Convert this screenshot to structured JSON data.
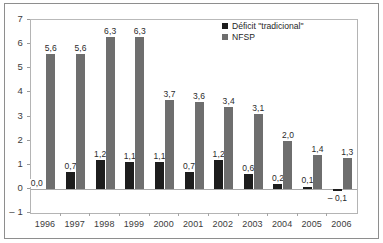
{
  "chart_data": {
    "type": "bar",
    "title": "",
    "xlabel": "",
    "ylabel": "",
    "categories": [
      "1996",
      "1997",
      "1998",
      "1999",
      "2000",
      "2001",
      "2002",
      "2003",
      "2004",
      "2005",
      "2006"
    ],
    "series": [
      {
        "name": "Déficit \"tradicional\"",
        "color": "#1d1d1d",
        "values": [
          0.0,
          0.7,
          1.2,
          1.1,
          1.1,
          0.7,
          1.2,
          0.6,
          0.2,
          0.1,
          -0.1
        ],
        "labels": [
          "0,0",
          "0,7",
          "1,2",
          "1,1",
          "1,1",
          "0,7",
          "1,2",
          "0,6",
          "0,2",
          "0,1",
          "– 0,1"
        ]
      },
      {
        "name": "NFSP",
        "color": "#6e6e6e",
        "values": [
          5.6,
          5.6,
          6.3,
          6.3,
          3.7,
          3.6,
          3.4,
          3.1,
          2.0,
          1.4,
          1.3
        ],
        "labels": [
          "5,6",
          "5,6",
          "6,3",
          "6,3",
          "3,7",
          "3,6",
          "3,4",
          "3,1",
          "2,0",
          "1,4",
          "1,3"
        ]
      }
    ],
    "ylim": [
      -1,
      7
    ],
    "yticks": [
      -1,
      0,
      1,
      2,
      3,
      4,
      5,
      6,
      7
    ],
    "ytick_labels": [
      "– 1",
      "0",
      "1",
      "2",
      "3",
      "4",
      "5",
      "6",
      "7"
    ],
    "grid": false,
    "legend_position": "top-right"
  },
  "legend": {
    "items": [
      {
        "label": "Déficit \"tradicional\"",
        "swatch": "deficit"
      },
      {
        "label": "NFSP",
        "swatch": "nfsp"
      }
    ]
  }
}
